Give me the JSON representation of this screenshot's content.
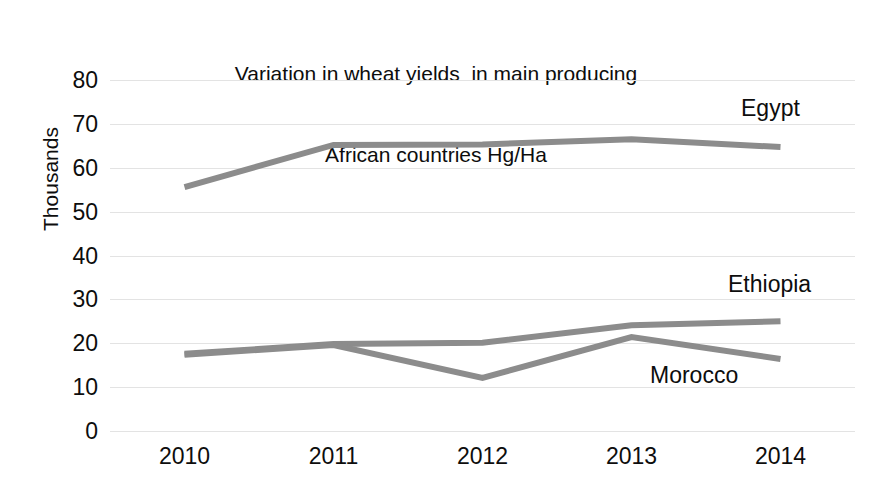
{
  "chart_data": {
    "type": "line",
    "title": "Variation in wheat yields  in main producing\nAfrican countries Hg/Ha",
    "title_line1": "Variation in wheat yields  in main producing",
    "title_line2": "African countries Hg/Ha",
    "xlabel": "",
    "ylabel": "Thousands",
    "x": [
      "2010",
      "2011",
      "2012",
      "2013",
      "2014"
    ],
    "categories": [
      "2010",
      "2011",
      "2012",
      "2013",
      "2014"
    ],
    "ylim": [
      0,
      80
    ],
    "ytick_values": [
      80,
      70,
      60,
      50,
      40,
      30,
      20,
      10,
      0
    ],
    "ytick_labels": [
      "80",
      "70",
      "60",
      "50",
      "40",
      "30",
      "20",
      "10",
      "0"
    ],
    "grid": true,
    "grid_axis": "y",
    "legend": "direct-labels",
    "series": [
      {
        "name": "Egypt",
        "values": [
          55.6,
          65.2,
          65.3,
          66.5,
          64.7
        ],
        "color": "#8c8c8c",
        "label_x": 741,
        "label_y": 95
      },
      {
        "name": "Ethiopia",
        "values": [
          17.6,
          19.8,
          20.1,
          24.1,
          25.0
        ],
        "color": "#8c8c8c",
        "label_x": 728,
        "label_y": 271
      },
      {
        "name": "Morocco",
        "values": [
          17.4,
          19.6,
          12.1,
          21.4,
          16.4
        ],
        "color": "#8c8c8c",
        "label_x": 650,
        "label_y": 362
      }
    ],
    "line_width": 6,
    "grid_color": "#e3e3e3",
    "text_color": "#0d0d0d",
    "background_color": "#ffffff"
  }
}
